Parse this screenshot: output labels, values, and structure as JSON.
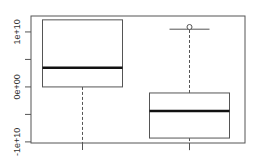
{
  "chart_data": {
    "type": "boxplot",
    "title": "",
    "xlabel": "",
    "ylabel": "",
    "ylim": [
      -10200000000.0,
      12900000000.0
    ],
    "yticks": [
      {
        "value": -10000000000.0,
        "label": "-1e+10"
      },
      {
        "value": -5000000000.0,
        "label": ""
      },
      {
        "value": 0,
        "label": "0e+00"
      },
      {
        "value": 5000000000.0,
        "label": ""
      },
      {
        "value": 10000000000.0,
        "label": "1e+10"
      }
    ],
    "grid": false,
    "categories": [
      "1",
      "2"
    ],
    "show_category_labels": false,
    "series": [
      {
        "name": "group-1",
        "whisker_low": -11500000000.0,
        "q1": 0,
        "median": 3500000000.0,
        "q3": 12200000000.0,
        "whisker_high": 12200000000.0,
        "outliers": []
      },
      {
        "name": "group-2",
        "whisker_low": -11500000000.0,
        "q1": -9300000000.0,
        "median": -4400000000.0,
        "q3": -1100000000.0,
        "whisker_high": 10500000000.0,
        "outliers": [
          10900000000.0
        ]
      }
    ]
  }
}
